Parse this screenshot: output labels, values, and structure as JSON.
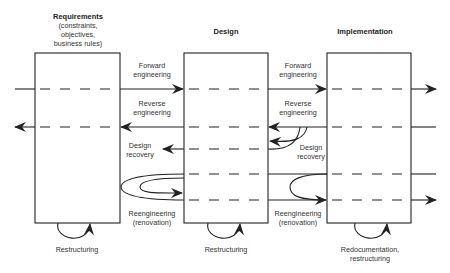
{
  "diagram": {
    "type": "reverse-engineering-lifecycle",
    "stages": [
      {
        "title": "Requirements",
        "subtitle_lines": [
          "(constraints,",
          "objectives,",
          "business rules)"
        ]
      },
      {
        "title": "Design",
        "subtitle_lines": []
      },
      {
        "title": "Implementation",
        "subtitle_lines": []
      }
    ],
    "transitions": {
      "forward_engineering": {
        "line1": "Forward",
        "line2": "engineering"
      },
      "reverse_engineering": {
        "line1": "Reverse",
        "line2": "engineering"
      },
      "design_recovery": {
        "line1": "Design",
        "line2": "recovery"
      },
      "reengineering": {
        "line1": "Reengineering",
        "line2": "(renovation)"
      }
    },
    "self_loops": [
      {
        "stage": "Requirements",
        "line1": "Restructuring",
        "line2": ""
      },
      {
        "stage": "Design",
        "line1": "Restructuring",
        "line2": ""
      },
      {
        "stage": "Implementation",
        "line1": "Redocumentation,",
        "line2": "restructuring"
      }
    ],
    "colors": {
      "stroke": "#222222",
      "text": "#333333",
      "background": "#ffffff"
    }
  }
}
